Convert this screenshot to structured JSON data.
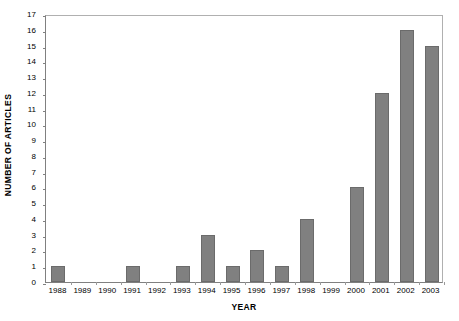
{
  "chart_data": {
    "type": "bar",
    "title": "",
    "xlabel": "YEAR",
    "ylabel": "NUMBER OF ARTICLES",
    "categories": [
      "1988",
      "1989",
      "1990",
      "1991",
      "1992",
      "1993",
      "1994",
      "1995",
      "1996",
      "1997",
      "1998",
      "1999",
      "2000",
      "2001",
      "2002",
      "2003"
    ],
    "values": [
      1,
      0,
      0,
      1,
      0,
      1,
      3,
      1,
      2,
      1,
      4,
      0,
      6,
      12,
      16,
      15
    ],
    "series": [
      {
        "name": "Number of articles",
        "values": [
          1,
          0,
          0,
          1,
          0,
          1,
          3,
          1,
          2,
          1,
          4,
          0,
          6,
          12,
          16,
          15
        ]
      }
    ],
    "ylim": [
      0,
      17
    ],
    "ytick_step": 1,
    "yticks": [
      0,
      1,
      2,
      3,
      4,
      5,
      6,
      7,
      8,
      9,
      10,
      11,
      12,
      13,
      14,
      15,
      16,
      17
    ],
    "ytick_labels": [
      "0",
      "1",
      "2",
      "3",
      "4",
      "5",
      "6",
      "7",
      "8",
      "9",
      "10",
      "11",
      "12",
      "13",
      "14",
      "15",
      "16",
      "17"
    ],
    "grid": false,
    "legend": false,
    "legend_position": "none",
    "bar_color": "#808080",
    "bar_edge_color": "#6b6b6b",
    "plot_border_color": "#b0b0b0",
    "axis_color": "#808080",
    "background_color": "#ffffff",
    "annotations": []
  }
}
